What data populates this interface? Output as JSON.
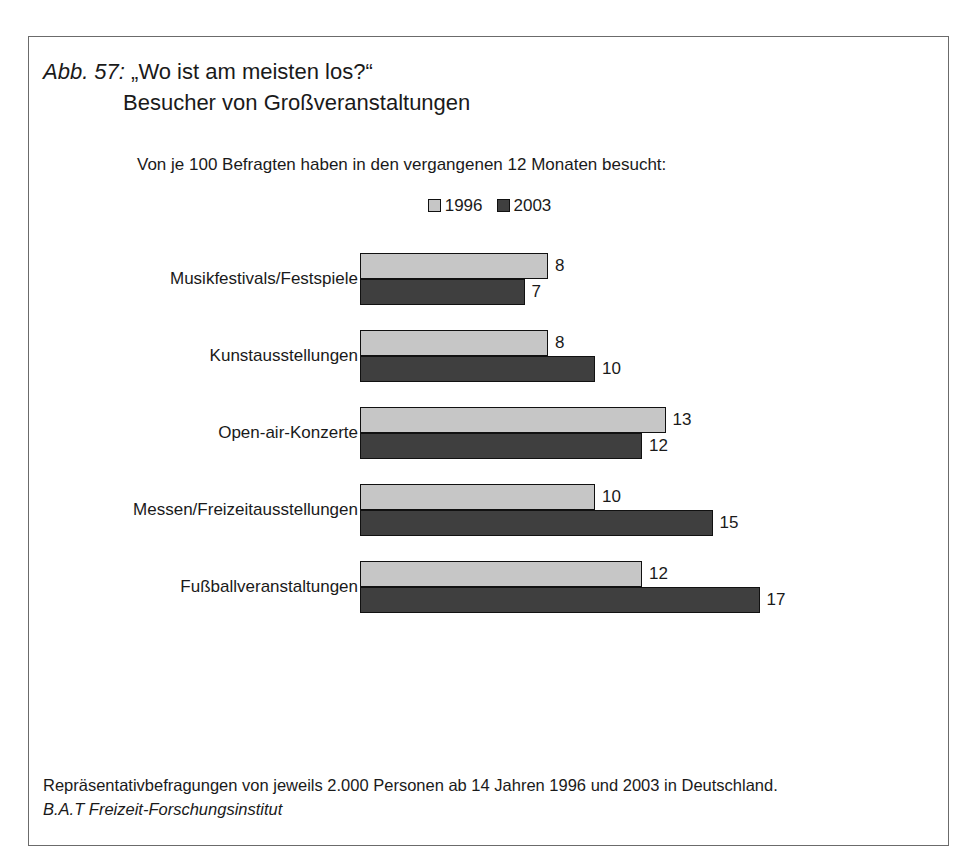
{
  "figure": {
    "number_label": "Abb. 57:",
    "title_quoted": "„Wo ist am meisten los?“",
    "title_line2": "Besucher von Großveranstaltungen",
    "subtitle": "Von je 100 Befragten haben in den vergangenen 12 Monaten besucht:"
  },
  "legend": {
    "items": [
      {
        "label": "1996",
        "color": "#c6c6c6"
      },
      {
        "label": "2003",
        "color": "#3f3f3f"
      }
    ]
  },
  "footer": {
    "line1": "Repräsentativbefragungen von jeweils 2.000 Personen ab 14 Jahren 1996 und 2003 in Deutschland.",
    "line2": "B.A.T Freizeit-Forschungsinstitut"
  },
  "chart_data": {
    "type": "bar",
    "orientation": "horizontal",
    "title": "Abb. 57: „Wo ist am meisten los?“ Besucher von Großveranstaltungen",
    "subtitle": "Von je 100 Befragten haben in den vergangenen 12 Monaten besucht:",
    "xlabel": "",
    "ylabel": "",
    "xlim": [
      0,
      18
    ],
    "grid": false,
    "legend_position": "top-center",
    "categories": [
      "Musikfestivals/Festspiele",
      "Kunstausstellungen",
      "Open-air-Konzerte",
      "Messen/Freizeitausstellungen",
      "Fußballveranstaltungen"
    ],
    "series": [
      {
        "name": "1996",
        "color": "#c6c6c6",
        "values": [
          8,
          8,
          13,
          10,
          12
        ]
      },
      {
        "name": "2003",
        "color": "#3f3f3f",
        "values": [
          7,
          10,
          12,
          15,
          17
        ]
      }
    ],
    "value_labels": {
      "1996": [
        "8",
        "8",
        "13",
        "10",
        "12"
      ],
      "2003": [
        "7",
        "10",
        "12",
        "15",
        "17"
      ]
    },
    "source": "Repräsentativbefragungen von jeweils 2.000 Personen ab 14 Jahren 1996 und 2003 in Deutschland. B.A.T Freizeit-Forschungsinstitut"
  },
  "scale": {
    "px_per_unit": 23.5
  }
}
